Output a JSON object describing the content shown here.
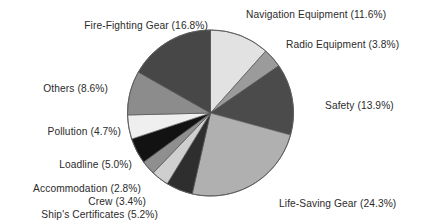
{
  "chart_data": {
    "type": "pie",
    "title": "",
    "xlabel": "",
    "ylabel": "",
    "legend_position": "callout-labels",
    "grid": false,
    "units": "percent",
    "total": 100.1,
    "start_angle_deg": -90,
    "direction": "clockwise",
    "categories": [
      "Navigation Equipment",
      "Radio Equipment",
      "Safety",
      "Life-Saving Gear",
      "Ship's Certificates",
      "Crew",
      "Accommodation",
      "Loadline",
      "Pollution",
      "Others",
      "Fire-Fighting Gear"
    ],
    "values": [
      11.6,
      3.8,
      13.9,
      24.3,
      5.2,
      3.4,
      2.8,
      5.0,
      4.7,
      8.6,
      16.8
    ],
    "colors": [
      "#e2e2e2",
      "#9b9b9b",
      "#4b4b4b",
      "#b0b0b0",
      "#2e2e2e",
      "#cfcfcf",
      "#8f8f8f",
      "#121212",
      "#efefef",
      "#8c8c8c",
      "#474747"
    ],
    "slices": [
      {
        "label": "Navigation Equipment",
        "value": 11.6,
        "label_text": "Navigation Equipment (11.6%)",
        "color": "#e2e2e2"
      },
      {
        "label": "Radio Equipment",
        "value": 3.8,
        "label_text": "Radio Equipment (3.8%)",
        "color": "#9b9b9b"
      },
      {
        "label": "Safety",
        "value": 13.9,
        "label_text": "Safety (13.9%)",
        "color": "#4b4b4b"
      },
      {
        "label": "Life-Saving Gear",
        "value": 24.3,
        "label_text": "Life-Saving Gear (24.3%)",
        "color": "#b0b0b0"
      },
      {
        "label": "Ship's Certificates",
        "value": 5.2,
        "label_text": "Ship's Certificates (5.2%)",
        "color": "#2e2e2e"
      },
      {
        "label": "Crew",
        "value": 3.4,
        "label_text": "Crew (3.4%)",
        "color": "#cfcfcf"
      },
      {
        "label": "Accommodation",
        "value": 2.8,
        "label_text": "Accommodation (2.8%)",
        "color": "#8f8f8f"
      },
      {
        "label": "Loadline",
        "value": 5.0,
        "label_text": "Loadline (5.0%)",
        "color": "#121212"
      },
      {
        "label": "Pollution",
        "value": 4.7,
        "label_text": "Pollution (4.7%)",
        "color": "#efefef"
      },
      {
        "label": "Others",
        "value": 8.6,
        "label_text": "Others (8.6%)",
        "color": "#8c8c8c"
      },
      {
        "label": "Fire-Fighting Gear",
        "value": 16.8,
        "label_text": "Fire-Fighting Gear (16.8%)",
        "color": "#474747"
      }
    ]
  },
  "labels": {
    "navigation_equipment": "Navigation Equipment (11.6%)",
    "radio_equipment": "Radio Equipment (3.8%)",
    "safety": "Safety (13.9%)",
    "life_saving_gear": "Life-Saving Gear (24.3%)",
    "ships_certificates": "Ship's Certificates (5.2%)",
    "crew": "Crew (3.4%)",
    "accommodation": "Accommodation (2.8%)",
    "loadline": "Loadline (5.0%)",
    "pollution": "Pollution (4.7%)",
    "others": "Others (8.6%)",
    "fire_fighting_gear": "Fire-Fighting Gear (16.8%)"
  },
  "geometry": {
    "center_x": 210.5,
    "center_y": 113,
    "radius": 83
  }
}
